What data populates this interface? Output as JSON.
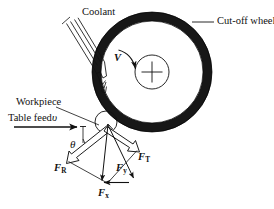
{
  "figure": {
    "kind": "engineering-schematic",
    "background_color": "#ffffff",
    "ink_color": "#111111",
    "wheel_color": "#1a1a1a"
  },
  "labels": {
    "coolant": "Coolant",
    "cut_off_wheel": "Cut-off wheel",
    "workpiece": "Workpiece",
    "table_feed": "Table feed",
    "table_feed_symbol": "υ",
    "wheel_speed_symbol": "V",
    "angle_symbol": "θ"
  },
  "forces": [
    {
      "id": "F_R",
      "base": "F",
      "sub": "R",
      "description": "resultant force",
      "arrow_style": "hollow"
    },
    {
      "id": "F_T",
      "base": "F",
      "sub": "T",
      "description": "tangential force",
      "arrow_style": "hollow"
    },
    {
      "id": "F_y",
      "base": "F",
      "sub": "y",
      "description": "vertical force component",
      "arrow_style": "solid"
    },
    {
      "id": "F_x",
      "base": "F",
      "sub": "x",
      "description": "horizontal force component",
      "arrow_style": "solid"
    }
  ],
  "geometry": {
    "wheel_center": {
      "x": 152,
      "y": 72
    },
    "wheel_outer_radius": 60,
    "wheel_rim_thickness": 9,
    "hub_radius": 17,
    "contact_point": {
      "x": 105,
      "y": 123
    },
    "workpiece_circle_radius": 11,
    "feed_arrow": {
      "x1": 14,
      "y1": 127,
      "x2": 79,
      "y2": 127
    }
  }
}
